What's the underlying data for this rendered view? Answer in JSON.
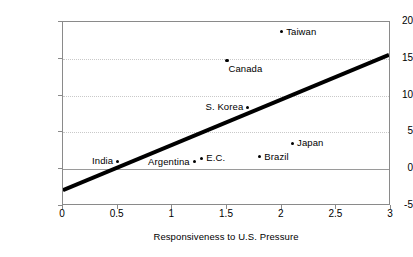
{
  "chart_data": {
    "type": "scatter",
    "title": "",
    "xlabel": "Responsiveness to U.S. Pressure",
    "ylabel": "Exports to U.S./GNP",
    "xlim": [
      0,
      3
    ],
    "ylim": [
      -5,
      20
    ],
    "xticks": [
      "0",
      "0.5",
      "1",
      "1.5",
      "2",
      "2.5",
      "3"
    ],
    "xtick_values": [
      0,
      0.5,
      1,
      1.5,
      2,
      2.5,
      3
    ],
    "yticks": [
      "20",
      "15",
      "10",
      "5",
      "0",
      "-5"
    ],
    "ytick_values": [
      20,
      15,
      10,
      5,
      0,
      -5
    ],
    "grid": "horizontal-dotted",
    "zero_line": true,
    "legend": "none",
    "points": [
      {
        "label": "Taiwan",
        "x": 2.0,
        "y": 18.7,
        "label_pos": "right"
      },
      {
        "label": "Canada",
        "x": 1.5,
        "y": 14.8,
        "label_pos": "below-right"
      },
      {
        "label": "S. Korea",
        "x": 1.69,
        "y": 8.4,
        "label_pos": "left"
      },
      {
        "label": "Japan",
        "x": 2.1,
        "y": 3.5,
        "label_pos": "right"
      },
      {
        "label": "Brazil",
        "x": 1.8,
        "y": 1.7,
        "label_pos": "right"
      },
      {
        "label": "E.C.",
        "x": 1.27,
        "y": 1.5,
        "label_pos": "right"
      },
      {
        "label": "Argentina",
        "x": 1.2,
        "y": 1.0,
        "label_pos": "left"
      },
      {
        "label": "India",
        "x": 0.5,
        "y": 1.1,
        "label_pos": "left"
      }
    ],
    "trendline": {
      "x0": 0,
      "y0": -3.0,
      "x1": 3,
      "y1": 15.5,
      "color": "#000000",
      "width": 4
    },
    "colors": {
      "point": "#000000",
      "grid": "#c9c9c9",
      "axis": "#8a8a8a",
      "zero": "#9a9a9a",
      "background": "#ffffff"
    }
  }
}
